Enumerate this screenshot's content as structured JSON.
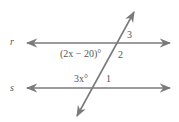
{
  "diagram": {
    "lines": [
      {
        "name": "r",
        "label": "r"
      },
      {
        "name": "s",
        "label": "s"
      },
      {
        "name": "transversal"
      }
    ],
    "angles": {
      "angle_3": "3",
      "angle_2": "2",
      "angle_1": "1",
      "angle_2x_minus_20": "(2x − 20)°",
      "angle_3x": "3x°"
    },
    "colors": {
      "line": "#7a7a7a",
      "text": "#555555"
    }
  }
}
